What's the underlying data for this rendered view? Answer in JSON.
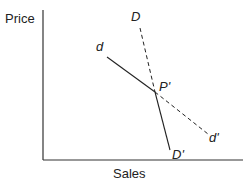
{
  "diagram": {
    "type": "economics-demand-curves",
    "axes": {
      "y_label": "Price",
      "x_label": "Sales"
    },
    "curves": [
      {
        "id": "d",
        "label_start": "d",
        "label_end": "d'",
        "style": "solid-then-dashed",
        "description": "Flatter demand curve d through P' to d'"
      },
      {
        "id": "D",
        "label_start": "D",
        "label_end": "D'",
        "style": "dashed-then-solid",
        "description": "Steeper demand curve D through P' to D'"
      }
    ],
    "intersection": {
      "label": "P'"
    },
    "colors": {
      "line": "#222222",
      "background": "#ffffff"
    }
  }
}
